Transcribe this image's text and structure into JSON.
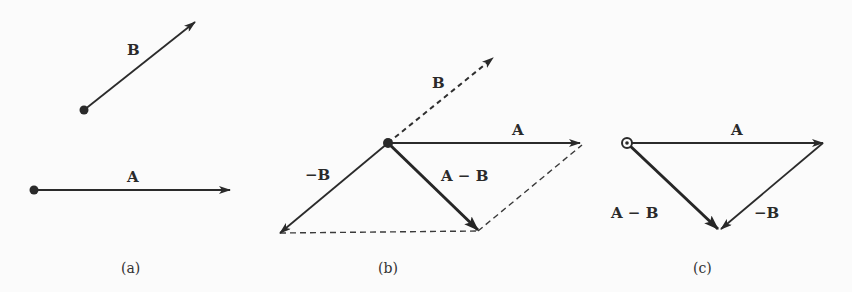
{
  "figure": {
    "colors": {
      "ink": "#2a2a2a",
      "background": "#fbfbfb"
    },
    "panels": [
      {
        "id": "a",
        "caption": "(a)",
        "vectors": [
          {
            "label": "B",
            "style": "solid",
            "from": [
              84,
              110
            ],
            "to": [
              195,
              22
            ]
          },
          {
            "label": "A",
            "style": "solid",
            "from": [
              34,
              190
            ],
            "to": [
              230,
              190
            ]
          }
        ]
      },
      {
        "id": "b",
        "caption": "(b)",
        "vectors": [
          {
            "label": "B",
            "style": "dashed",
            "from": [
              388,
              143
            ],
            "to": [
              493,
              58
            ]
          },
          {
            "label": "A",
            "style": "solid",
            "from": [
              388,
              143
            ],
            "to": [
              580,
              143
            ]
          },
          {
            "label": "−B",
            "style": "solid",
            "from": [
              388,
              143
            ],
            "to": [
              280,
              233
            ]
          },
          {
            "label": "A − B",
            "style": "thick",
            "from": [
              388,
              143
            ],
            "to": [
              478,
              230
            ]
          }
        ],
        "construction_lines": [
          {
            "from": [
              280,
              233
            ],
            "to": [
              478,
              231
            ]
          },
          {
            "from": [
              478,
              231
            ],
            "to": [
              582,
              145
            ]
          }
        ]
      },
      {
        "id": "c",
        "caption": "(c)",
        "vectors": [
          {
            "label": "A",
            "style": "solid",
            "from": [
              627,
              143
            ],
            "to": [
              823,
              143
            ]
          },
          {
            "label": "A − B",
            "style": "thick",
            "from": [
              627,
              143
            ],
            "to": [
              718,
              229
            ]
          },
          {
            "label": "−B",
            "style": "solid",
            "from": [
              823,
              143
            ],
            "to": [
              720,
              229
            ]
          }
        ]
      }
    ],
    "labels": {
      "a_B": "B",
      "a_A": "A",
      "b_B": "B",
      "b_A": "A",
      "b_negB": "−B",
      "b_AminusB": "A − B",
      "c_A": "A",
      "c_AminusB": "A − B",
      "c_negB": "−B"
    },
    "captions": {
      "a": "(a)",
      "b": "(b)",
      "c": "(c)"
    }
  }
}
